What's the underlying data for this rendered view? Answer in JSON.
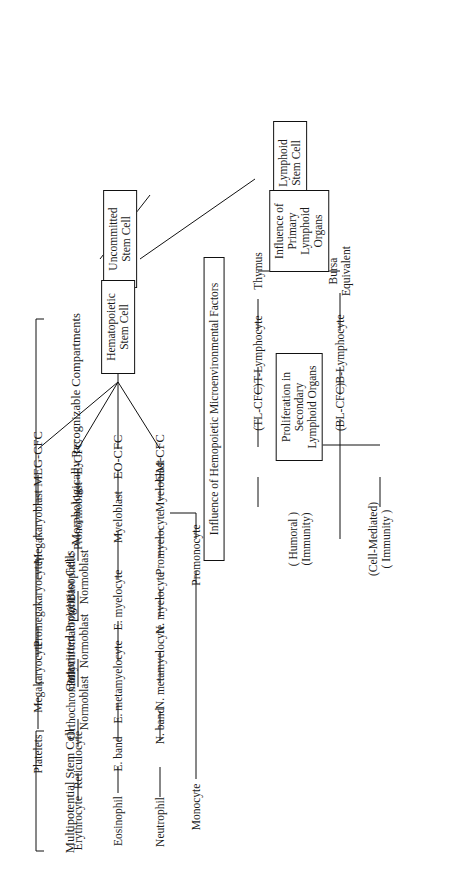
{
  "diagram": {
    "header_sections": [
      {
        "id": "multipotential",
        "label": "Multipotential\nStem Cell"
      },
      {
        "id": "committed",
        "label": "Committed\nProgenitor Cells"
      },
      {
        "id": "morphologic",
        "label": "Morphologically\nRecognizable\nCompartments"
      }
    ],
    "annotations": [
      {
        "id": "hemo-influence",
        "label": "Influence of Hemopoietic Microenvironmental Factors"
      },
      {
        "id": "lymphoid-influence",
        "label": "Influence of\nPrimary Lymphoid Organs"
      },
      {
        "id": "secondary-lymphoid",
        "label": "Proliferation in Secondary\nLymphoid Organs"
      }
    ],
    "stem_cells": [
      {
        "id": "uncommitted",
        "label": "Uncommitted\nStem Cell"
      },
      {
        "id": "hematopoietic",
        "label": "Hematopoietic\nStem Cell"
      },
      {
        "id": "lymphoid",
        "label": "Lymphoid\nStem Cell"
      }
    ],
    "progenitors": [
      {
        "id": "gm-cfc",
        "label": "GM-CFC"
      },
      {
        "id": "eo-cfc",
        "label": "EO-CFC"
      },
      {
        "id": "e-cfc",
        "label": "E-CFC"
      },
      {
        "id": "meg-cfc",
        "label": "MEG-CFC"
      },
      {
        "id": "tl-cfc",
        "label": "(TL-CFC)"
      },
      {
        "id": "bl-cfc",
        "label": "(BL-CFC)"
      }
    ],
    "lymphoid_branch": {
      "t_line": {
        "organ": "Thymus",
        "cell": "T-Lymphocyte",
        "cfc": "(TL-CFC)",
        "outcome": "(Cell-Mediated)\n( Immunity )"
      },
      "b_line": {
        "organ": "Bursa\nEquivalent",
        "cell": "B-Lymphocyte",
        "cfc": "(BL-CFC)",
        "outcome": "( Humoral )\n(Immunity)"
      }
    },
    "columns": [
      {
        "id": "granulocyte-monocyte",
        "progenitor": "GM-CFC",
        "stages": [
          "Myeloblast",
          "Promyelocyte",
          "N. myelocyte",
          "N. metamyelocyte",
          "N. band",
          "Neutrophil"
        ],
        "secondary_stages": [
          "Promonocyte",
          "Monocyte"
        ]
      },
      {
        "id": "eosinophil",
        "progenitor": "EO-CFC",
        "stages": [
          "Myeloblast",
          "E. myelocyte",
          "E. metamyelocyte",
          "E. band",
          "Eosinophil"
        ]
      },
      {
        "id": "erythrocyte",
        "progenitor": "E-CFC",
        "stages": [
          "Pronormoblast",
          "Basophilic\nNormoblast",
          "Polychromatophilic\nNormoblast",
          "Orthochromatic\nNormoblast",
          "Reticulocyte",
          "Erythrocyte"
        ]
      },
      {
        "id": "megakaryocyte",
        "progenitor": "MEG-CFC",
        "stages": [
          "Megakaryoblast",
          "Promegakaryocyte",
          "Megakaryocyte",
          "Platelets"
        ]
      }
    ]
  }
}
